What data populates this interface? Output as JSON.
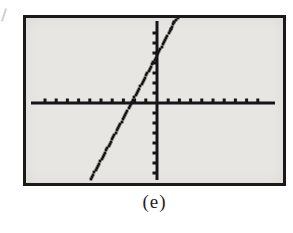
{
  "page": {
    "background": "#ffffff"
  },
  "figure": {
    "caption": "(e)",
    "frame_color": "#1a1a1a",
    "screen_background": "#e7e6e3",
    "ink_color": "#161616"
  },
  "chart_data": {
    "type": "line",
    "title": "",
    "caption": "(e)",
    "style": "graphing-calculator-screen",
    "grid": false,
    "legend": false,
    "x_axis": {
      "min": -10,
      "max": 10,
      "tick_step": 1,
      "label": ""
    },
    "y_axis": {
      "min": -8,
      "max": 8,
      "tick_step": 1,
      "label": ""
    },
    "series": [
      {
        "name": "plotted-line",
        "shape": "steep straight line, positive slope, slight rightward hook at top of screen",
        "slope_estimate": 2,
        "x_intercept_estimate": -2.2,
        "y_intercept_estimate": 4.5,
        "points_x": [
          -5.9,
          1.25,
          1.55,
          1.85
        ],
        "points_y": [
          -7.6,
          7.4,
          8.1,
          8.5
        ]
      }
    ],
    "layout_hints": {
      "origin_px": [
        131,
        85
      ],
      "px_per_unit_x": 11.2,
      "px_per_unit_y": 10,
      "x_axis_px_extent": [
        5,
        249
      ],
      "y_axis_px_extent": [
        3,
        162
      ],
      "x_tick_range": [
        -10,
        9
      ],
      "y_tick_range": [
        -7,
        7
      ],
      "axis_thickness_px": 3,
      "tick_size_px": 3
    }
  }
}
